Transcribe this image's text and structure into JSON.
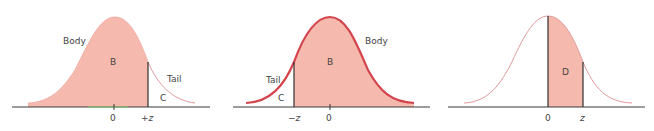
{
  "colors": {
    "fill": "#f5b9ad",
    "curve_thin": "#e49a9e",
    "curve_thick": "#d4444c",
    "axis": "#3a3a3a",
    "divider": "#2f2f2f",
    "axis_highlight": "#7ccf6a",
    "text": "#444444"
  },
  "panels": [
    {
      "id": "panel-1",
      "labels": {
        "body": "Body",
        "region_main": "B",
        "tail": "Tail",
        "region_tail": "C"
      },
      "ticks": {
        "zero": "0",
        "z": "+z"
      }
    },
    {
      "id": "panel-2",
      "labels": {
        "body": "Body",
        "region_main": "B",
        "tail": "Tail",
        "region_tail": "C"
      },
      "ticks": {
        "neg_z": "−z",
        "zero": "0"
      }
    },
    {
      "id": "panel-3",
      "labels": {
        "region": "D"
      },
      "ticks": {
        "zero": "0",
        "z": "z"
      }
    }
  ]
}
